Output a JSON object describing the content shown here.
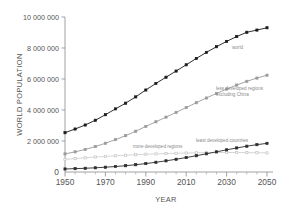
{
  "chart_data": {
    "type": "line",
    "title": "",
    "xlabel": "YEAR",
    "ylabel": "WORLD POPULATION",
    "xlim": [
      1950,
      2050
    ],
    "ylim": [
      0,
      10000000
    ],
    "grid": false,
    "legend_position": "inline-annotations",
    "x_ticks": [
      "1950",
      "1970",
      "1990",
      "2010",
      "2030",
      "2050"
    ],
    "x_tick_values": [
      1950,
      1970,
      1990,
      2010,
      2030,
      2050
    ],
    "x_minor_step": 5,
    "y_ticks": [
      "0",
      "2 000 000",
      "4 000 000",
      "6 000 000",
      "8 000 000",
      "10 000 000"
    ],
    "y_tick_values": [
      0,
      2000000,
      4000000,
      6000000,
      8000000,
      10000000
    ],
    "x": [
      1950,
      1955,
      1960,
      1965,
      1970,
      1975,
      1980,
      1985,
      1990,
      1995,
      2000,
      2005,
      2010,
      2015,
      2020,
      2025,
      2030,
      2035,
      2040,
      2045,
      2050
    ],
    "series": [
      {
        "name": "world",
        "label": "world",
        "color": "#1a1a1a",
        "marker": "filled-square",
        "values": [
          2535000,
          2773000,
          3032000,
          3339000,
          3696000,
          4073000,
          4440000,
          4846000,
          5290000,
          5713000,
          6115000,
          6512000,
          6916000,
          7325000,
          7717000,
          8083000,
          8425000,
          8739000,
          9015000,
          9157000,
          9306000
        ]
      },
      {
        "name": "less-developed-regions-excluding-china",
        "label": "less developed regions\nexcluding China",
        "label_line1": "less developed regions",
        "label_line2": "excluding China",
        "color": "#9b9b9b",
        "marker": "filled-square",
        "values": [
          1169000,
          1300000,
          1455000,
          1640000,
          1855000,
          2090000,
          2345000,
          2630000,
          2940000,
          3240000,
          3540000,
          3845000,
          4160000,
          4470000,
          4775000,
          5070000,
          5350000,
          5610000,
          5850000,
          6060000,
          6245000
        ]
      },
      {
        "name": "more-developed-regions",
        "label": "more developed regions",
        "color": "#c4c4c4",
        "marker": "open-square",
        "values": [
          813000,
          864000,
          915000,
          967000,
          1008000,
          1047000,
          1083000,
          1115000,
          1148000,
          1169000,
          1189000,
          1208000,
          1227000,
          1241000,
          1250000,
          1256000,
          1258000,
          1256000,
          1251000,
          1243000,
          1233000
        ]
      },
      {
        "name": "least-developed-countries",
        "label": "least developed countries",
        "color": "#2b2b2b",
        "marker": "filled-square",
        "values": [
          196000,
          216000,
          240000,
          270000,
          309000,
          354000,
          406000,
          469000,
          544000,
          628000,
          720000,
          822000,
          932000,
          1050000,
          1175000,
          1303000,
          1430000,
          1552000,
          1664000,
          1763000,
          1848000
        ]
      }
    ]
  }
}
